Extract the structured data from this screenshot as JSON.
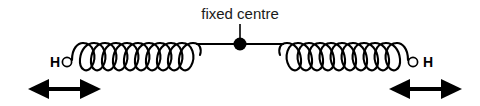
{
  "figure": {
    "background_color": "#ffffff",
    "stroke_color": "#000000",
    "text_color": "#1a1a1a",
    "width": 480,
    "height": 106,
    "center_label": "fixed centre",
    "left_atom_label": "H",
    "right_atom_label": "H",
    "left_spring": {
      "name": "left-spring",
      "coil_count": 11,
      "start_x": 72,
      "end_x": 196,
      "axis_y": 44,
      "loop_bottom_y": 71
    },
    "right_spring": {
      "name": "right-spring",
      "coil_count": 11,
      "start_x": 284,
      "end_x": 408,
      "axis_y": 44,
      "loop_bottom_y": 71
    },
    "fixed_centre_node": {
      "x": 240,
      "y": 44,
      "radius": 6.5
    },
    "leader_line": {
      "x": 240,
      "y_top": 24,
      "y_bottom": 44
    },
    "left_arrow": {
      "name": "left-oscillation-arrow",
      "x_start": 28,
      "x_end": 101,
      "y": 89,
      "direction": "double"
    },
    "right_arrow": {
      "name": "right-oscillation-arrow",
      "x_start": 389,
      "x_end": 462,
      "y": 89,
      "direction": "double"
    }
  }
}
